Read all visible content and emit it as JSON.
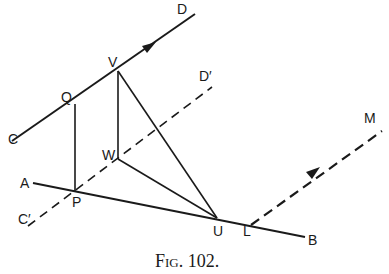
{
  "figure": {
    "caption": "Fig. 102.",
    "labels": {
      "C": "C",
      "D": "D",
      "C_prime": "C′",
      "D_prime": "D′",
      "Q": "Q",
      "V": "V",
      "W": "W",
      "P": "P",
      "A": "A",
      "B": "B",
      "U": "U",
      "L": "L",
      "M": "M"
    },
    "points": {
      "C_end": [
        12,
        141
      ],
      "D_end": [
        195,
        14
      ],
      "Q": [
        75,
        104
      ],
      "V": [
        118,
        71
      ],
      "Cp_end": [
        28,
        226
      ],
      "Dp_end": [
        212,
        87
      ],
      "W": [
        118,
        159
      ],
      "P": [
        75,
        191
      ],
      "A_end": [
        33,
        183
      ],
      "B_end": [
        305,
        237
      ],
      "U": [
        217,
        218
      ],
      "L": [
        251,
        225
      ],
      "M_end": [
        382,
        131
      ]
    },
    "lines": [
      {
        "name": "line-CD",
        "style": "solid",
        "from": "C",
        "to": "D",
        "arrow": true
      },
      {
        "name": "line-CpDp",
        "style": "dashed",
        "from": "C′",
        "to": "D′"
      },
      {
        "name": "line-AB",
        "style": "solid",
        "from": "A",
        "to": "B"
      },
      {
        "name": "line-LM",
        "style": "dashed",
        "from": "L",
        "to": "M",
        "arrow": true
      },
      {
        "name": "segment-QP",
        "style": "solid"
      },
      {
        "name": "segment-VW",
        "style": "solid"
      },
      {
        "name": "segment-VU",
        "style": "solid"
      },
      {
        "name": "segment-WU",
        "style": "solid"
      }
    ]
  }
}
